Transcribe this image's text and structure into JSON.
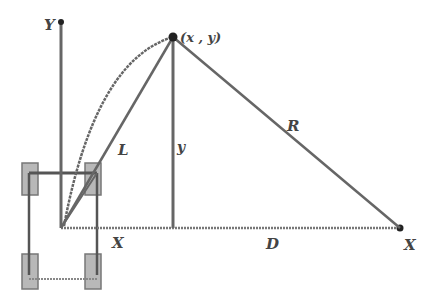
{
  "diagram": {
    "labels": {
      "y_axis": "Y",
      "point": "(x , y)",
      "L": "L",
      "y": "y",
      "R": "R",
      "X_near": "X",
      "D": "D",
      "X_axis": "X"
    },
    "colors": {
      "line": "#666666",
      "dark": "#222222",
      "wheel": "#b0b0b0",
      "background": "#ffffff"
    }
  }
}
